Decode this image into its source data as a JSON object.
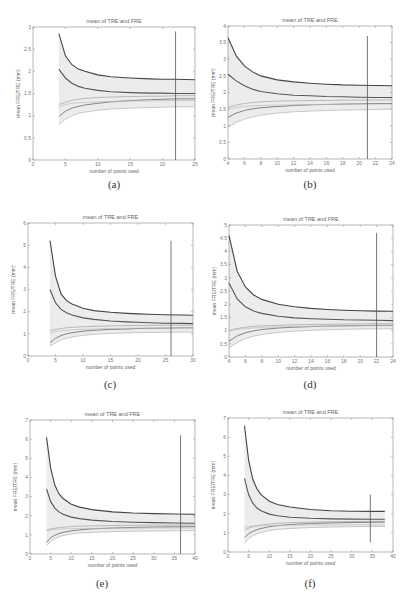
{
  "figure": {
    "panels": [
      "a",
      "b",
      "c",
      "d",
      "e",
      "f"
    ]
  },
  "chart_data": [
    {
      "id": "a",
      "caption": "(a)",
      "type": "line",
      "title": "mean of TRE and FRE",
      "xlabel": "number of points used",
      "ylabel": "mean FRE/TRE (mm)",
      "xlim": [
        0,
        25
      ],
      "ylim": [
        0,
        3
      ],
      "xticks": [
        0,
        5,
        10,
        15,
        20,
        25
      ],
      "yticks": [
        0,
        0.5,
        1,
        1.5,
        2,
        2.5,
        3
      ],
      "vline_x": 22,
      "vline_range": [
        0,
        2.9
      ],
      "x": [
        4,
        5,
        6,
        7,
        8,
        10,
        12,
        15,
        18,
        20,
        22,
        25
      ],
      "series": [
        {
          "name": "TRE upper",
          "values": [
            2.85,
            2.35,
            2.15,
            2.05,
            2.0,
            1.92,
            1.88,
            1.85,
            1.83,
            1.82,
            1.82,
            1.81
          ],
          "color": "#444444",
          "width": 1.1
        },
        {
          "name": "TRE mean",
          "values": [
            2.05,
            1.85,
            1.73,
            1.66,
            1.62,
            1.57,
            1.54,
            1.52,
            1.51,
            1.51,
            1.5,
            1.5
          ],
          "color": "#555555",
          "width": 1.1
        },
        {
          "name": "FRE upper",
          "values": [
            1.25,
            1.3,
            1.35,
            1.37,
            1.39,
            1.41,
            1.42,
            1.43,
            1.44,
            1.44,
            1.45,
            1.45
          ],
          "color": "#aaaaaa",
          "width": 0.8
        },
        {
          "name": "FRE mean",
          "values": [
            0.98,
            1.1,
            1.17,
            1.21,
            1.24,
            1.28,
            1.31,
            1.34,
            1.36,
            1.37,
            1.38,
            1.38
          ],
          "color": "#777777",
          "width": 0.9
        },
        {
          "name": "FRE lower",
          "values": [
            0.8,
            0.92,
            1.0,
            1.05,
            1.08,
            1.12,
            1.15,
            1.17,
            1.18,
            1.19,
            1.2,
            1.2
          ],
          "color": "#bbbbbb",
          "width": 0.8
        },
        {
          "name": "TRE lower",
          "values": [
            1.2,
            1.25,
            1.28,
            1.29,
            1.3,
            1.31,
            1.32,
            1.33,
            1.33,
            1.34,
            1.34,
            1.34
          ],
          "color": "#bbbbbb",
          "width": 0.7
        }
      ]
    },
    {
      "id": "b",
      "caption": "(b)",
      "type": "line",
      "title": "mean of TRE and FRE",
      "xlabel": "number of points used",
      "ylabel": "mean FRE/TRE (mm)",
      "xlim": [
        4,
        24
      ],
      "ylim": [
        0,
        4
      ],
      "xticks": [
        4,
        6,
        8,
        10,
        12,
        14,
        16,
        18,
        20,
        22,
        24
      ],
      "yticks": [
        0,
        0.5,
        1,
        1.5,
        2,
        2.5,
        3,
        3.5,
        4
      ],
      "vline_x": 21,
      "vline_range": [
        0,
        3.7
      ],
      "x": [
        4,
        5,
        6,
        7,
        8,
        10,
        12,
        14,
        16,
        18,
        20,
        22,
        24
      ],
      "series": [
        {
          "name": "TRE upper",
          "values": [
            3.65,
            3.1,
            2.8,
            2.62,
            2.5,
            2.38,
            2.32,
            2.28,
            2.25,
            2.23,
            2.22,
            2.21,
            2.2
          ],
          "color": "#444444",
          "width": 1.1
        },
        {
          "name": "TRE mean",
          "values": [
            2.55,
            2.35,
            2.2,
            2.1,
            2.03,
            1.96,
            1.92,
            1.9,
            1.88,
            1.87,
            1.86,
            1.85,
            1.85
          ],
          "color": "#555555",
          "width": 1.1
        },
        {
          "name": "FRE upper",
          "values": [
            1.55,
            1.62,
            1.67,
            1.7,
            1.72,
            1.74,
            1.75,
            1.76,
            1.76,
            1.77,
            1.77,
            1.77,
            1.78
          ],
          "color": "#aaaaaa",
          "width": 0.8
        },
        {
          "name": "FRE mean",
          "values": [
            1.25,
            1.38,
            1.46,
            1.51,
            1.54,
            1.58,
            1.61,
            1.63,
            1.64,
            1.65,
            1.66,
            1.67,
            1.67
          ],
          "color": "#777777",
          "width": 0.9
        },
        {
          "name": "FRE lower",
          "values": [
            0.95,
            1.1,
            1.2,
            1.27,
            1.32,
            1.38,
            1.42,
            1.44,
            1.46,
            1.47,
            1.48,
            1.49,
            1.5
          ],
          "color": "#bbbbbb",
          "width": 0.8
        },
        {
          "name": "TRE lower",
          "values": [
            1.5,
            1.55,
            1.58,
            1.6,
            1.61,
            1.62,
            1.63,
            1.64,
            1.64,
            1.65,
            1.65,
            1.65,
            1.65
          ],
          "color": "#bbbbbb",
          "width": 0.7
        }
      ]
    },
    {
      "id": "c",
      "caption": "(c)",
      "type": "line",
      "title": "mean of TRE and FRE",
      "xlabel": "number of points used",
      "ylabel": "mean FRE/TRE (mm)",
      "xlim": [
        0,
        30
      ],
      "ylim": [
        0,
        6
      ],
      "xticks": [
        0,
        5,
        10,
        15,
        20,
        25,
        30
      ],
      "yticks": [
        0,
        1,
        2,
        3,
        4,
        5,
        6
      ],
      "vline_x": 26,
      "vline_range": [
        0,
        5.2
      ],
      "x": [
        4,
        5,
        6,
        7,
        8,
        10,
        12,
        15,
        18,
        20,
        22,
        25,
        28,
        30
      ],
      "series": [
        {
          "name": "TRE upper",
          "values": [
            5.2,
            3.6,
            2.8,
            2.5,
            2.35,
            2.15,
            2.05,
            1.97,
            1.92,
            1.9,
            1.88,
            1.86,
            1.85,
            1.84
          ],
          "color": "#444444",
          "width": 1.1
        },
        {
          "name": "TRE mean",
          "values": [
            3.0,
            2.4,
            2.1,
            1.95,
            1.85,
            1.72,
            1.65,
            1.58,
            1.54,
            1.52,
            1.5,
            1.48,
            1.47,
            1.46
          ],
          "color": "#555555",
          "width": 1.1
        },
        {
          "name": "FRE upper",
          "values": [
            1.15,
            1.2,
            1.24,
            1.27,
            1.29,
            1.32,
            1.34,
            1.36,
            1.37,
            1.38,
            1.38,
            1.39,
            1.39,
            1.39
          ],
          "color": "#aaaaaa",
          "width": 0.8
        },
        {
          "name": "FRE mean",
          "values": [
            0.6,
            0.8,
            0.92,
            1.0,
            1.05,
            1.12,
            1.16,
            1.2,
            1.22,
            1.24,
            1.25,
            1.26,
            1.27,
            1.27
          ],
          "color": "#777777",
          "width": 0.9
        },
        {
          "name": "FRE lower",
          "values": [
            0.45,
            0.6,
            0.72,
            0.8,
            0.86,
            0.93,
            0.98,
            1.02,
            1.04,
            1.05,
            1.06,
            1.07,
            1.08,
            1.08
          ],
          "color": "#bbbbbb",
          "width": 0.8
        },
        {
          "name": "TRE lower",
          "values": [
            1.05,
            1.1,
            1.14,
            1.16,
            1.18,
            1.2,
            1.22,
            1.24,
            1.25,
            1.26,
            1.26,
            1.27,
            1.27,
            1.27
          ],
          "color": "#bbbbbb",
          "width": 0.7
        }
      ]
    },
    {
      "id": "d",
      "caption": "(d)",
      "type": "line",
      "title": "mean of TRE and FRE",
      "xlabel": "number of points used",
      "ylabel": "mean FRE/TRE (mm)",
      "xlim": [
        4,
        24
      ],
      "ylim": [
        0,
        5
      ],
      "xticks": [
        4,
        6,
        8,
        10,
        12,
        14,
        16,
        18,
        20,
        22,
        24
      ],
      "yticks": [
        0,
        0.5,
        1,
        1.5,
        2,
        2.5,
        3,
        3.5,
        4,
        4.5,
        5
      ],
      "vline_x": 22,
      "vline_range": [
        0,
        4.7
      ],
      "x": [
        4,
        5,
        6,
        7,
        8,
        10,
        12,
        14,
        16,
        18,
        20,
        22,
        24
      ],
      "series": [
        {
          "name": "TRE upper",
          "values": [
            4.6,
            3.25,
            2.65,
            2.35,
            2.18,
            2.0,
            1.9,
            1.84,
            1.8,
            1.77,
            1.75,
            1.74,
            1.73
          ],
          "color": "#444444",
          "width": 1.1
        },
        {
          "name": "TRE mean",
          "values": [
            2.8,
            2.2,
            1.9,
            1.74,
            1.65,
            1.54,
            1.48,
            1.45,
            1.43,
            1.41,
            1.4,
            1.39,
            1.38
          ],
          "color": "#555555",
          "width": 1.1
        },
        {
          "name": "FRE upper",
          "values": [
            1.0,
            1.08,
            1.13,
            1.16,
            1.18,
            1.2,
            1.22,
            1.23,
            1.24,
            1.25,
            1.25,
            1.26,
            1.26
          ],
          "color": "#aaaaaa",
          "width": 0.8
        },
        {
          "name": "FRE mean",
          "values": [
            0.6,
            0.8,
            0.92,
            0.99,
            1.04,
            1.1,
            1.13,
            1.15,
            1.17,
            1.18,
            1.19,
            1.2,
            1.2
          ],
          "color": "#777777",
          "width": 0.9
        },
        {
          "name": "FRE lower",
          "values": [
            0.35,
            0.55,
            0.7,
            0.79,
            0.85,
            0.93,
            0.98,
            1.01,
            1.03,
            1.05,
            1.06,
            1.07,
            1.07
          ],
          "color": "#bbbbbb",
          "width": 0.8
        },
        {
          "name": "TRE lower",
          "values": [
            1.0,
            1.05,
            1.08,
            1.1,
            1.12,
            1.14,
            1.15,
            1.16,
            1.17,
            1.17,
            1.18,
            1.18,
            1.18
          ],
          "color": "#bbbbbb",
          "width": 0.7
        }
      ]
    },
    {
      "id": "e",
      "caption": "(e)",
      "type": "line",
      "title": "mean of TRE and FRE",
      "xlabel": "number of points used",
      "ylabel": "mean FRE/TRE (mm)",
      "xlim": [
        0,
        40
      ],
      "ylim": [
        0,
        7
      ],
      "xticks": [
        0,
        5,
        10,
        15,
        20,
        25,
        30,
        35,
        40
      ],
      "yticks": [
        0,
        1,
        2,
        3,
        4,
        5,
        6,
        7
      ],
      "vline_x": 36.5,
      "vline_range": [
        0,
        6.2
      ],
      "x": [
        4,
        5,
        6,
        7,
        8,
        10,
        12,
        15,
        20,
        25,
        30,
        35,
        40
      ],
      "series": [
        {
          "name": "TRE upper",
          "values": [
            6.1,
            4.5,
            3.6,
            3.15,
            2.9,
            2.6,
            2.45,
            2.32,
            2.2,
            2.14,
            2.11,
            2.09,
            2.08
          ],
          "color": "#444444",
          "width": 1.1
        },
        {
          "name": "TRE mean",
          "values": [
            3.4,
            2.75,
            2.4,
            2.2,
            2.08,
            1.93,
            1.85,
            1.77,
            1.7,
            1.66,
            1.64,
            1.62,
            1.61
          ],
          "color": "#555555",
          "width": 1.1
        },
        {
          "name": "FRE upper",
          "values": [
            1.25,
            1.3,
            1.35,
            1.38,
            1.4,
            1.43,
            1.45,
            1.47,
            1.49,
            1.5,
            1.51,
            1.51,
            1.52
          ],
          "color": "#aaaaaa",
          "width": 0.8
        },
        {
          "name": "FRE mean",
          "values": [
            0.6,
            0.85,
            0.98,
            1.07,
            1.13,
            1.21,
            1.26,
            1.31,
            1.36,
            1.39,
            1.41,
            1.42,
            1.43
          ],
          "color": "#777777",
          "width": 0.9
        },
        {
          "name": "FRE lower",
          "values": [
            0.45,
            0.65,
            0.8,
            0.9,
            0.96,
            1.04,
            1.09,
            1.13,
            1.17,
            1.19,
            1.2,
            1.21,
            1.22
          ],
          "color": "#bbbbbb",
          "width": 0.8
        },
        {
          "name": "TRE lower",
          "values": [
            1.2,
            1.25,
            1.28,
            1.3,
            1.31,
            1.32,
            1.33,
            1.34,
            1.35,
            1.35,
            1.36,
            1.36,
            1.36
          ],
          "color": "#bbbbbb",
          "width": 0.7
        }
      ]
    },
    {
      "id": "f",
      "caption": "(f)",
      "type": "line",
      "title": "mean of TRE and FRE",
      "xlabel": "number of points used",
      "ylabel": "mean FRE/TRE (mm)",
      "xlim": [
        0,
        40
      ],
      "ylim": [
        0,
        7
      ],
      "xticks": [
        0,
        5,
        10,
        15,
        20,
        25,
        30,
        35,
        40
      ],
      "yticks": [
        0,
        1,
        2,
        3,
        4,
        5,
        6,
        7
      ],
      "vline_x": 34.5,
      "vline_range": [
        0.5,
        3.0
      ],
      "x": [
        4,
        5,
        6,
        7,
        8,
        10,
        12,
        15,
        20,
        25,
        30,
        35,
        38
      ],
      "series": [
        {
          "name": "TRE upper",
          "values": [
            6.6,
            4.8,
            3.8,
            3.3,
            3.0,
            2.65,
            2.48,
            2.35,
            2.22,
            2.16,
            2.13,
            2.12,
            2.12
          ],
          "color": "#444444",
          "width": 1.1
        },
        {
          "name": "TRE mean",
          "values": [
            3.85,
            3.0,
            2.55,
            2.3,
            2.15,
            1.98,
            1.89,
            1.82,
            1.76,
            1.73,
            1.72,
            1.71,
            1.71
          ],
          "color": "#555555",
          "width": 1.1
        },
        {
          "name": "FRE upper",
          "values": [
            1.15,
            1.25,
            1.32,
            1.37,
            1.41,
            1.46,
            1.5,
            1.53,
            1.56,
            1.58,
            1.59,
            1.6,
            1.6
          ],
          "color": "#aaaaaa",
          "width": 0.8
        },
        {
          "name": "FRE mean",
          "values": [
            0.75,
            0.95,
            1.08,
            1.17,
            1.23,
            1.32,
            1.38,
            1.43,
            1.49,
            1.52,
            1.54,
            1.55,
            1.56
          ],
          "color": "#777777",
          "width": 0.9
        },
        {
          "name": "FRE lower",
          "values": [
            0.45,
            0.7,
            0.85,
            0.95,
            1.02,
            1.12,
            1.18,
            1.23,
            1.28,
            1.3,
            1.32,
            1.33,
            1.33
          ],
          "color": "#bbbbbb",
          "width": 0.8
        },
        {
          "name": "TRE lower",
          "values": [
            1.3,
            1.33,
            1.35,
            1.36,
            1.37,
            1.38,
            1.39,
            1.4,
            1.41,
            1.41,
            1.42,
            1.42,
            1.42
          ],
          "color": "#bbbbbb",
          "width": 0.7
        }
      ]
    }
  ]
}
